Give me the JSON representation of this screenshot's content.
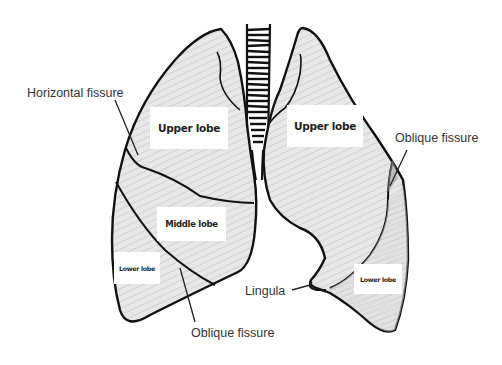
{
  "diagram": {
    "lobe_labels": {
      "right_upper": "Upper lobe",
      "right_middle": "Middle lobe",
      "right_lower": "Lower lobe",
      "left_upper": "Upper lobe",
      "left_lower": "Lower lobe"
    },
    "callouts": {
      "horizontal_fissure": "Horizontal fissure",
      "oblique_fissure_right": "Oblique fissure",
      "oblique_fissure_left": "Oblique fissure",
      "lingula": "Lingula"
    },
    "colors": {
      "outline": "#111111",
      "lung_fill": "#e6e6e6",
      "lung_shade": "#cfcfcf",
      "label_box": "#ffffff",
      "background": "#ffffff"
    }
  }
}
